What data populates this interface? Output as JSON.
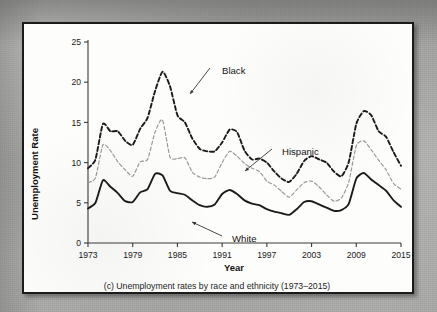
{
  "figure": {
    "caption": "(c) Unemployment rates by race and ethnicity (1973–2015)",
    "panel_border_color": "#1b1b1b",
    "panel_background": "#fdfdfc",
    "page_background": "#a9a9a7"
  },
  "labels": {
    "black": "Black",
    "hispanic": "Hispanic",
    "white": "White"
  },
  "axis": {
    "y_title": "Unemployment Rate",
    "x_title": "Year",
    "y_ticks": [
      "0",
      "5",
      "10",
      "15",
      "20",
      "25"
    ],
    "x_ticks": [
      "1973",
      "1979",
      "1985",
      "1991",
      "1997",
      "2003",
      "2009",
      "2015"
    ]
  },
  "chart_data": {
    "type": "line",
    "title": "(c) Unemployment rates by race and ethnicity (1973–2015)",
    "xlabel": "Year",
    "ylabel": "Unemployment Rate",
    "xlim": [
      1973,
      2015
    ],
    "ylim": [
      0,
      25
    ],
    "yticks": [
      0,
      5,
      10,
      15,
      20,
      25
    ],
    "xticks": [
      1973,
      1979,
      1985,
      1991,
      1997,
      2003,
      2009,
      2015
    ],
    "grid": false,
    "legend": "inline-annotations",
    "annotations": [
      {
        "text": "Black",
        "series": "Black",
        "year": 1984,
        "value": 19.5
      },
      {
        "text": "Hispanic",
        "series": "Hispanic",
        "year": 1994,
        "value": 11.3
      },
      {
        "text": "White",
        "series": "White",
        "year": 1990,
        "value": 4.6
      }
    ],
    "x": [
      1973,
      1974,
      1975,
      1976,
      1977,
      1978,
      1979,
      1980,
      1981,
      1982,
      1983,
      1984,
      1985,
      1986,
      1987,
      1988,
      1989,
      1990,
      1991,
      1992,
      1993,
      1994,
      1995,
      1996,
      1997,
      1998,
      1999,
      2000,
      2001,
      2002,
      2003,
      2004,
      2005,
      2006,
      2007,
      2008,
      2009,
      2010,
      2011,
      2012,
      2013,
      2014,
      2015
    ],
    "series": [
      {
        "name": "Black",
        "style": "heavy-dashed",
        "color": "#1b1b1b",
        "values": [
          9.3,
          10.4,
          14.8,
          13.9,
          13.9,
          12.7,
          12.2,
          14.2,
          15.6,
          18.9,
          21.3,
          19.5,
          15.9,
          15.0,
          13.0,
          11.7,
          11.4,
          11.4,
          12.5,
          14.1,
          13.8,
          11.5,
          10.4,
          10.5,
          10.0,
          8.9,
          8.0,
          7.6,
          8.6,
          10.2,
          10.8,
          10.4,
          10.0,
          8.9,
          8.3,
          10.1,
          14.8,
          16.4,
          15.9,
          13.9,
          13.2,
          11.3,
          9.6
        ]
      },
      {
        "name": "Hispanic",
        "style": "light-dashed",
        "color": "#9a9a9a",
        "values": [
          7.5,
          8.1,
          12.2,
          11.5,
          10.1,
          9.1,
          8.3,
          10.1,
          10.4,
          13.8,
          15.3,
          10.7,
          10.5,
          10.6,
          8.8,
          8.2,
          8.0,
          8.2,
          10.0,
          11.4,
          10.8,
          9.9,
          9.3,
          8.9,
          7.7,
          7.2,
          6.4,
          5.7,
          6.6,
          7.5,
          7.7,
          7.0,
          6.0,
          5.2,
          5.6,
          7.6,
          12.1,
          12.7,
          11.6,
          10.3,
          9.1,
          7.4,
          6.7
        ]
      },
      {
        "name": "White",
        "style": "solid",
        "color": "#1b1b1b",
        "values": [
          4.3,
          5.0,
          7.8,
          7.0,
          6.2,
          5.2,
          5.1,
          6.3,
          6.7,
          8.6,
          8.4,
          6.5,
          6.2,
          6.0,
          5.3,
          4.7,
          4.5,
          4.8,
          6.1,
          6.6,
          6.1,
          5.3,
          4.9,
          4.7,
          4.2,
          3.9,
          3.7,
          3.5,
          4.2,
          5.1,
          5.2,
          4.8,
          4.4,
          4.0,
          4.1,
          4.9,
          8.0,
          8.7,
          7.9,
          7.2,
          6.5,
          5.3,
          4.5
        ]
      }
    ]
  }
}
